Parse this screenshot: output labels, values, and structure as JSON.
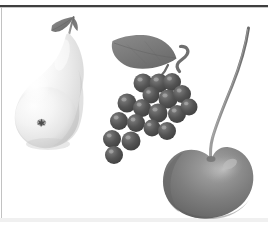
{
  "document": {
    "title": "Fruit Illustration",
    "description": "Grayscale clip-art illustration of three fruits on a white page",
    "background_color": "#ffffff",
    "width": 268,
    "height": 229
  },
  "rules": {
    "top_rule": {
      "name": "top-horizontal-rule",
      "color": "#3f3f3f",
      "y": 6,
      "thickness": 2,
      "x_start": 0,
      "x_end": 268
    },
    "left_rule": {
      "name": "left-vertical-rule",
      "color": "#b8b8b8",
      "x": 1,
      "thickness": 1,
      "y_start": 6,
      "y_end": 222
    },
    "bottom_rule": {
      "name": "bottom-horizontal-rule",
      "color": "#efefef",
      "y": 219,
      "thickness": 4,
      "x_start": 0,
      "x_end": 268
    }
  },
  "palette": {
    "page_white": "#ffffff",
    "pear_highlight": "#fdfdfd",
    "pear_light": "#f2f2f2",
    "pear_mid": "#e2e2e2",
    "pear_shadow": "#cfcfcf",
    "pear_edge": "#bdbdbd",
    "pear_blemish": "#5a5a5a",
    "leaf_dark": "#6e6e6e",
    "leaf_mid": "#7d7d7d",
    "leaf_light": "#8f8f8f",
    "grape_dark": "#4a4a4a",
    "grape_mid": "#5c5c5c",
    "grape_highlight": "#8a8a8a",
    "cherry_dark": "#6a6a6a",
    "cherry_mid": "#7c7c7c",
    "cherry_highlight": "#a8a8a8",
    "cherry_edge": "#5e5e5e",
    "stem_dark": "#707070",
    "stem_light": "#9a9a9a",
    "rule_dark": "#3f3f3f",
    "rule_light": "#b8b8b8",
    "rule_faint": "#efefef"
  },
  "fruits": [
    {
      "id": "pear",
      "label": "Pear",
      "position": {
        "cx": 52,
        "cy": 100
      },
      "body_color": "#ececec",
      "highlight_color": "#fdfdfd",
      "shadow_color": "#cdcdcd",
      "has_leaf": true,
      "leaf_color": "#757575",
      "has_stem": true,
      "stem_color": "#8a8a8a",
      "blemish": {
        "cx": 41,
        "cy": 122,
        "color": "#5a5a5a"
      }
    },
    {
      "id": "grape-cluster",
      "label": "Grape cluster",
      "position": {
        "cx": 140,
        "cy": 110
      },
      "berry_color": "#4e4e4e",
      "berry_highlight": "#8a8a8a",
      "berry_count": 18,
      "has_leaf": true,
      "leaf_color": "#767676",
      "has_tendril": true,
      "tendril_color": "#6f6f6f",
      "berries": [
        {
          "cx": 143,
          "cy": 83,
          "r": 9.5
        },
        {
          "cx": 159,
          "cy": 83,
          "r": 9.5
        },
        {
          "cx": 172,
          "cy": 82,
          "r": 9.0
        },
        {
          "cx": 151,
          "cy": 95,
          "r": 8.5
        },
        {
          "cx": 168,
          "cy": 99,
          "r": 9.5
        },
        {
          "cx": 182,
          "cy": 94,
          "r": 9.0
        },
        {
          "cx": 127,
          "cy": 103,
          "r": 9.5
        },
        {
          "cx": 142,
          "cy": 108,
          "r": 9.0
        },
        {
          "cx": 158,
          "cy": 113,
          "r": 9.5
        },
        {
          "cx": 177,
          "cy": 114,
          "r": 9.0
        },
        {
          "cx": 189,
          "cy": 107,
          "r": 8.5
        },
        {
          "cx": 119,
          "cy": 121,
          "r": 9.0
        },
        {
          "cx": 136,
          "cy": 123,
          "r": 9.0
        },
        {
          "cx": 152,
          "cy": 128,
          "r": 8.5
        },
        {
          "cx": 167,
          "cy": 131,
          "r": 9.0
        },
        {
          "cx": 112,
          "cy": 139,
          "r": 9.0
        },
        {
          "cx": 131,
          "cy": 141,
          "r": 9.5
        },
        {
          "cx": 114,
          "cy": 155,
          "r": 9.0
        }
      ]
    },
    {
      "id": "cherry",
      "label": "Cherry",
      "position": {
        "cx": 213,
        "cy": 177
      },
      "body_color": "#7c7c7c",
      "highlight_color": "#a8a8a8",
      "shadow_color": "#5e5e5e",
      "has_stem": true,
      "stem_color": "#8a8a8a",
      "stem_top": {
        "x": 248,
        "y": 28
      },
      "stem_base": {
        "x": 212,
        "y": 160
      }
    }
  ]
}
